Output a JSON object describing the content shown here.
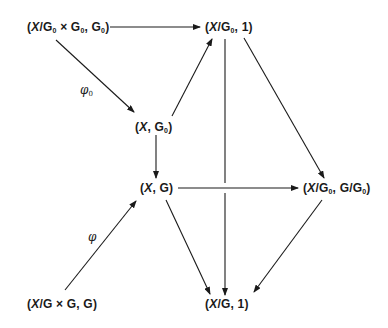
{
  "diagram": {
    "type": "commutative-diagram",
    "nodes": [
      {
        "id": "A",
        "text": "(X/G0 × G0, G0)",
        "parts": [
          "(",
          "X",
          "/G",
          "0",
          " × G",
          "0",
          ", G",
          "0",
          ")"
        ],
        "x": 27,
        "y": 20
      },
      {
        "id": "B",
        "text": "(X/G0, 1)",
        "parts": [
          "(",
          "X",
          "/G",
          "0",
          ", 1)"
        ],
        "x": 205,
        "y": 20
      },
      {
        "id": "C",
        "text": "(X, G0)",
        "parts": [
          "(",
          "X",
          ", G",
          "0",
          ")"
        ],
        "x": 135,
        "y": 120
      },
      {
        "id": "D",
        "text": "(X, G)",
        "parts": [
          "(",
          "X",
          ", G)"
        ],
        "x": 140,
        "y": 181
      },
      {
        "id": "E",
        "text": "(X/G0, G/G0)",
        "parts": [
          "(",
          "X",
          "/G",
          "0",
          ", G/G",
          "0",
          ")"
        ],
        "x": 303,
        "y": 181
      },
      {
        "id": "F",
        "text": "(X/G × G, G)",
        "parts": [
          "(",
          "X",
          "/G × G, G)"
        ],
        "x": 27,
        "y": 297
      },
      {
        "id": "G",
        "text": "(X/G, 1)",
        "parts": [
          "(",
          "X",
          "/G, 1)"
        ],
        "x": 205,
        "y": 297
      }
    ],
    "edges": [
      {
        "from": "A",
        "to": "B",
        "label": ""
      },
      {
        "from": "A",
        "to": "C",
        "label": "φ0"
      },
      {
        "from": "C",
        "to": "B",
        "label": ""
      },
      {
        "from": "C",
        "to": "D",
        "label": ""
      },
      {
        "from": "B",
        "to": "G",
        "label": "",
        "crossing_gap": true
      },
      {
        "from": "B",
        "to": "E",
        "label": ""
      },
      {
        "from": "D",
        "to": "E",
        "label": ""
      },
      {
        "from": "D",
        "to": "G",
        "label": ""
      },
      {
        "from": "E",
        "to": "G",
        "label": ""
      },
      {
        "from": "F",
        "to": "D",
        "label": "φ"
      }
    ],
    "labels": {
      "phi0": {
        "base": "φ",
        "sub": "0"
      },
      "phi": {
        "base": "φ"
      }
    },
    "colors": {
      "line": "#1a1a1a",
      "text": "#1a1a1a",
      "background": "#ffffff"
    }
  }
}
